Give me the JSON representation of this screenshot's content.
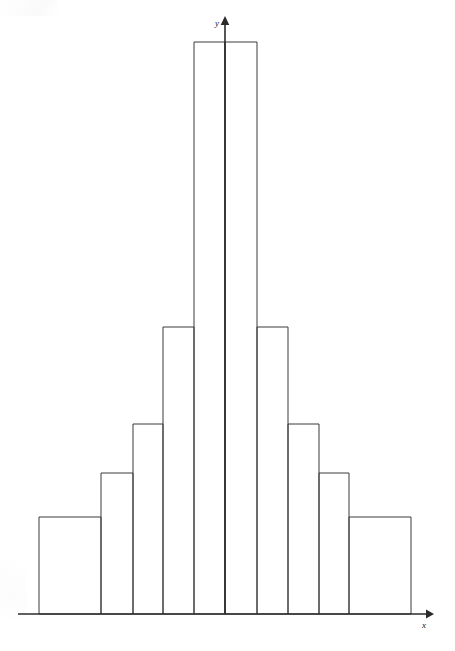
{
  "figure": {
    "title": "",
    "background_color": "#ffffff",
    "line_color": "#3a3a3a",
    "axis_color": "#2b2b2b"
  },
  "axes": {
    "x_label": "x",
    "y_label": "y",
    "x_axis_name": "x-axis",
    "y_axis_name": "y-axis",
    "baseline_y_px": 614,
    "y_axis_x_px": 225,
    "x_axis_start_px": 18,
    "x_axis_end_px": 432,
    "y_axis_top_px": 17
  },
  "chart_data": {
    "type": "bar",
    "title": "",
    "xlabel": "x",
    "ylabel": "y",
    "grid": false,
    "legend": "none",
    "orientation": "vertical",
    "bin_edges_px": [
      39,
      101,
      133,
      163,
      194,
      225,
      257,
      288,
      319,
      349,
      411
    ],
    "bin_tops_px": [
      517,
      473,
      424,
      327,
      42,
      42,
      327,
      424,
      473,
      517
    ],
    "categories": [
      "b1",
      "b2",
      "b3",
      "b4",
      "b5",
      "b6",
      "b7",
      "b8",
      "b9",
      "b10"
    ],
    "values": [
      97,
      141,
      190,
      287,
      572,
      572,
      287,
      190,
      141,
      97
    ],
    "ylim": [
      0,
      600
    ],
    "xlim": [
      0,
      10
    ],
    "bars": [
      {
        "index": 0,
        "x0_px": 39,
        "x1_px": 101,
        "top_px": 517,
        "height_px": 97
      },
      {
        "index": 1,
        "x0_px": 101,
        "x1_px": 133,
        "top_px": 473,
        "height_px": 141
      },
      {
        "index": 2,
        "x0_px": 133,
        "x1_px": 163,
        "top_px": 424,
        "height_px": 190
      },
      {
        "index": 3,
        "x0_px": 163,
        "x1_px": 194,
        "top_px": 327,
        "height_px": 287
      },
      {
        "index": 4,
        "x0_px": 194,
        "x1_px": 225,
        "top_px": 42,
        "height_px": 572
      },
      {
        "index": 5,
        "x0_px": 225,
        "x1_px": 257,
        "top_px": 42,
        "height_px": 572
      },
      {
        "index": 6,
        "x0_px": 257,
        "x1_px": 288,
        "top_px": 327,
        "height_px": 287
      },
      {
        "index": 7,
        "x0_px": 288,
        "x1_px": 319,
        "top_px": 424,
        "height_px": 190
      },
      {
        "index": 8,
        "x0_px": 319,
        "x1_px": 349,
        "top_px": 473,
        "height_px": 141
      },
      {
        "index": 9,
        "x0_px": 349,
        "x1_px": 411,
        "top_px": 517,
        "height_px": 97
      }
    ],
    "steps": [
      {
        "level": 1,
        "x0_px": 39,
        "x1_px": 411,
        "top_px": 517
      },
      {
        "level": 2,
        "x0_px": 101,
        "x1_px": 348,
        "top_px": 473
      },
      {
        "level": 3,
        "x0_px": 132,
        "x1_px": 318,
        "top_px": 424
      },
      {
        "level": 4,
        "x0_px": 162,
        "x1_px": 288,
        "top_px": 327
      },
      {
        "level": 5,
        "x0_px": 193,
        "x1_px": 257,
        "top_px": 42
      }
    ]
  }
}
